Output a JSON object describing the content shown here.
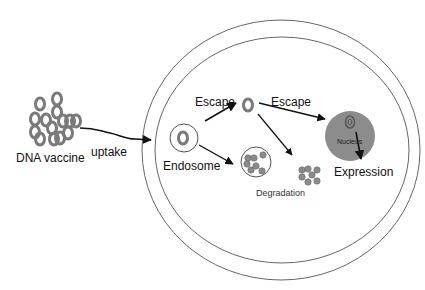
{
  "diagram": {
    "type": "biological-process",
    "labels": {
      "dna_vaccine": "DNA vaccine",
      "uptake": "uptake",
      "endosome": "Endosome",
      "escape_1": "Escape",
      "escape_2": "Escape",
      "degradation": "Degradation",
      "nucleus": "Nucleus",
      "expression": "Expression"
    },
    "nodes": [
      {
        "id": "dna_vaccine",
        "label": "DNA vaccine",
        "shape": "cluster-of-rings"
      },
      {
        "id": "endosome",
        "label": "Endosome",
        "shape": "circle-with-ring"
      },
      {
        "id": "escaped_plasmid",
        "label": "",
        "shape": "ring"
      },
      {
        "id": "degraded_in_endosome",
        "label": "",
        "shape": "circle-with-dots"
      },
      {
        "id": "degraded_cytoplasm",
        "label": "",
        "shape": "dots"
      },
      {
        "id": "nucleus",
        "label": "Nucleus",
        "shape": "filled-circle"
      },
      {
        "id": "expression",
        "label": "Expression",
        "shape": "text"
      }
    ],
    "edges": [
      {
        "from": "dna_vaccine",
        "to": "cell",
        "label": "uptake",
        "style": "wavy-arrow"
      },
      {
        "from": "endosome",
        "to": "escaped_plasmid",
        "label": "Escape"
      },
      {
        "from": "endosome",
        "to": "degraded_in_endosome",
        "label": ""
      },
      {
        "from": "escaped_plasmid",
        "to": "nucleus",
        "label": "Escape"
      },
      {
        "from": "escaped_plasmid",
        "to": "degraded_cytoplasm",
        "label": ""
      },
      {
        "from": "nucleus",
        "to": "expression",
        "label": ""
      }
    ],
    "group_label": {
      "text": "Degradation",
      "groups": [
        "degraded_in_endosome",
        "degraded_cytoplasm"
      ]
    },
    "colors": {
      "outline": "#555555",
      "ring": "#777777",
      "nucleus_fill": "#8c8c8c",
      "dot_fill": "#8a8a8a",
      "arrow": "#111111"
    }
  }
}
